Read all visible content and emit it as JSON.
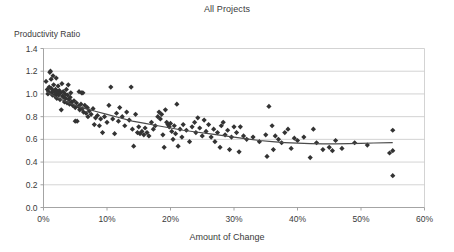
{
  "chart_data": {
    "type": "scatter",
    "title": "All Projects",
    "xlabel": "Amount of Change",
    "ylabel": "Productivity Ratio",
    "xlim": [
      0,
      60
    ],
    "ylim": [
      0.0,
      1.4
    ],
    "x_tick_labels": [
      "0%",
      "10%",
      "20%",
      "30%",
      "40%",
      "50%",
      "60%"
    ],
    "x_ticks": [
      0,
      10,
      20,
      30,
      40,
      50,
      60
    ],
    "y_tick_labels": [
      "0.0",
      "0.2",
      "0.4",
      "0.6",
      "0.8",
      "1.0",
      "1.2",
      "1.4"
    ],
    "y_ticks": [
      0.0,
      0.2,
      0.4,
      0.6,
      0.8,
      1.0,
      1.2,
      1.4
    ],
    "grid": "horizontal",
    "legend": "none",
    "marker": {
      "shape": "diamond",
      "color": "#333333",
      "size": 2.6
    },
    "series": [
      {
        "name": "Projects",
        "points": [
          [
            0.4,
            1.11
          ],
          [
            0.6,
            1.04
          ],
          [
            0.7,
            1.0
          ],
          [
            0.8,
            1.02
          ],
          [
            0.9,
            1.06
          ],
          [
            1.0,
            1.19
          ],
          [
            1.1,
            1.2
          ],
          [
            1.2,
            1.13
          ],
          [
            1.2,
            1.05
          ],
          [
            1.3,
            1.01
          ],
          [
            1.4,
            0.99
          ],
          [
            1.5,
            1.03
          ],
          [
            1.5,
            1.16
          ],
          [
            1.6,
            1.08
          ],
          [
            1.7,
            1.02
          ],
          [
            1.8,
            0.98
          ],
          [
            1.9,
            1.04
          ],
          [
            2.0,
            1.14
          ],
          [
            2.0,
            1.0
          ],
          [
            2.1,
            0.96
          ],
          [
            2.2,
            1.02
          ],
          [
            2.3,
            1.07
          ],
          [
            2.4,
            0.99
          ],
          [
            2.5,
            1.03
          ],
          [
            2.6,
            0.95
          ],
          [
            2.7,
            1.01
          ],
          [
            2.8,
            0.86
          ],
          [
            2.9,
            1.09
          ],
          [
            3.0,
            0.98
          ],
          [
            3.1,
            1.02
          ],
          [
            3.2,
            0.97
          ],
          [
            3.3,
            0.93
          ],
          [
            3.4,
            1.0
          ],
          [
            3.5,
            0.96
          ],
          [
            3.6,
            1.04
          ],
          [
            3.7,
            0.92
          ],
          [
            3.8,
            0.99
          ],
          [
            3.9,
            1.08
          ],
          [
            4.0,
            0.95
          ],
          [
            4.1,
            0.91
          ],
          [
            4.2,
            0.97
          ],
          [
            4.3,
            1.01
          ],
          [
            4.4,
            0.93
          ],
          [
            4.6,
            0.9
          ],
          [
            4.8,
            0.94
          ],
          [
            5.0,
            0.88
          ],
          [
            5.0,
            0.76
          ],
          [
            5.2,
            0.92
          ],
          [
            5.3,
            0.76
          ],
          [
            5.5,
            0.89
          ],
          [
            5.6,
            1.02
          ],
          [
            5.7,
            0.86
          ],
          [
            5.9,
            0.91
          ],
          [
            6.0,
            1.01
          ],
          [
            6.1,
            0.87
          ],
          [
            6.2,
            1.01
          ],
          [
            6.3,
            0.84
          ],
          [
            6.5,
            0.9
          ],
          [
            6.7,
            0.83
          ],
          [
            6.9,
            0.88
          ],
          [
            7.0,
            0.8
          ],
          [
            7.2,
            0.85
          ],
          [
            7.5,
            0.82
          ],
          [
            7.8,
            0.87
          ],
          [
            8.0,
            0.73
          ],
          [
            8.2,
            0.79
          ],
          [
            8.5,
            0.81
          ],
          [
            8.8,
            0.72
          ],
          [
            9.0,
            0.78
          ],
          [
            9.3,
            0.66
          ],
          [
            9.6,
            0.8
          ],
          [
            10.0,
            0.75
          ],
          [
            10.3,
            0.9
          ],
          [
            10.6,
            1.06
          ],
          [
            10.9,
            0.78
          ],
          [
            11.2,
            0.65
          ],
          [
            11.5,
            0.83
          ],
          [
            11.8,
            0.76
          ],
          [
            12.0,
            0.88
          ],
          [
            12.4,
            0.8
          ],
          [
            12.8,
            0.72
          ],
          [
            13.1,
            0.84
          ],
          [
            13.5,
            0.77
          ],
          [
            13.8,
            1.06
          ],
          [
            14.0,
            0.69
          ],
          [
            14.2,
            0.54
          ],
          [
            14.5,
            0.82
          ],
          [
            14.8,
            0.66
          ],
          [
            15.0,
            0.71
          ],
          [
            15.2,
            0.65
          ],
          [
            15.5,
            0.67
          ],
          [
            15.8,
            0.64
          ],
          [
            16.0,
            0.7
          ],
          [
            16.3,
            0.66
          ],
          [
            16.6,
            0.63
          ],
          [
            17.0,
            0.75
          ],
          [
            17.3,
            0.69
          ],
          [
            17.6,
            0.72
          ],
          [
            18.0,
            0.8
          ],
          [
            18.2,
            0.84
          ],
          [
            18.4,
            0.78
          ],
          [
            18.6,
            0.82
          ],
          [
            18.8,
            0.64
          ],
          [
            19.0,
            0.53
          ],
          [
            19.2,
            0.86
          ],
          [
            19.4,
            0.75
          ],
          [
            19.6,
            0.73
          ],
          [
            19.8,
            0.71
          ],
          [
            20.0,
            0.74
          ],
          [
            20.2,
            0.67
          ],
          [
            20.4,
            0.6
          ],
          [
            20.6,
            0.72
          ],
          [
            20.8,
            0.65
          ],
          [
            21.0,
            0.91
          ],
          [
            21.2,
            0.54
          ],
          [
            21.5,
            0.69
          ],
          [
            21.8,
            0.62
          ],
          [
            22.0,
            0.73
          ],
          [
            22.5,
            0.68
          ],
          [
            23.0,
            0.58
          ],
          [
            23.4,
            0.71
          ],
          [
            23.8,
            0.75
          ],
          [
            24.0,
            0.66
          ],
          [
            24.3,
            0.79
          ],
          [
            24.6,
            0.7
          ],
          [
            25.0,
            0.63
          ],
          [
            25.3,
            0.77
          ],
          [
            25.6,
            0.67
          ],
          [
            26.0,
            0.73
          ],
          [
            26.4,
            0.62
          ],
          [
            26.8,
            0.69
          ],
          [
            27.0,
            0.58
          ],
          [
            27.4,
            0.66
          ],
          [
            27.8,
            0.53
          ],
          [
            28.0,
            0.72
          ],
          [
            28.3,
            0.75
          ],
          [
            28.6,
            0.64
          ],
          [
            29.0,
            0.68
          ],
          [
            29.3,
            0.51
          ],
          [
            29.6,
            0.62
          ],
          [
            30.0,
            0.71
          ],
          [
            30.4,
            0.66
          ],
          [
            30.8,
            0.49
          ],
          [
            31.0,
            0.71
          ],
          [
            31.5,
            0.63
          ],
          [
            32.0,
            0.6
          ],
          [
            33.0,
            0.62
          ],
          [
            34.0,
            0.58
          ],
          [
            35.0,
            0.64
          ],
          [
            35.2,
            0.45
          ],
          [
            35.5,
            0.89
          ],
          [
            36.0,
            0.72
          ],
          [
            36.2,
            0.51
          ],
          [
            36.5,
            0.63
          ],
          [
            37.0,
            0.6
          ],
          [
            37.5,
            0.57
          ],
          [
            38.0,
            0.66
          ],
          [
            38.5,
            0.69
          ],
          [
            39.0,
            0.52
          ],
          [
            39.5,
            0.61
          ],
          [
            40.0,
            0.59
          ],
          [
            41.0,
            0.62
          ],
          [
            42.0,
            0.44
          ],
          [
            42.5,
            0.69
          ],
          [
            43.0,
            0.57
          ],
          [
            44.0,
            0.51
          ],
          [
            45.0,
            0.53
          ],
          [
            45.5,
            0.5
          ],
          [
            46.0,
            0.59
          ],
          [
            47.0,
            0.52
          ],
          [
            49.0,
            0.57
          ],
          [
            51.0,
            0.55
          ],
          [
            54.5,
            0.48
          ],
          [
            55.0,
            0.68
          ],
          [
            55.0,
            0.5
          ],
          [
            55.0,
            0.28
          ]
        ]
      }
    ],
    "trendline": {
      "name": "fitted curve",
      "color": "#4a4a4a",
      "points": [
        [
          0.5,
          1.02
        ],
        [
          2,
          0.97
        ],
        [
          4,
          0.92
        ],
        [
          6,
          0.88
        ],
        [
          8,
          0.85
        ],
        [
          10,
          0.82
        ],
        [
          12,
          0.79
        ],
        [
          14,
          0.76
        ],
        [
          16,
          0.74
        ],
        [
          18,
          0.72
        ],
        [
          20,
          0.7
        ],
        [
          22,
          0.68
        ],
        [
          24,
          0.665
        ],
        [
          26,
          0.65
        ],
        [
          28,
          0.635
        ],
        [
          30,
          0.62
        ],
        [
          32,
          0.605
        ],
        [
          34,
          0.59
        ],
        [
          36,
          0.58
        ],
        [
          38,
          0.572
        ],
        [
          40,
          0.566
        ],
        [
          42,
          0.562
        ],
        [
          44,
          0.56
        ],
        [
          46,
          0.56
        ],
        [
          48,
          0.562
        ],
        [
          50,
          0.565
        ],
        [
          52,
          0.568
        ],
        [
          55,
          0.572
        ]
      ]
    },
    "colors": {
      "marker": "#333333",
      "trendline": "#4a4a4a",
      "gridline": "#c8c8c8",
      "axis": "#9a9a9a",
      "text": "#3a3a3a",
      "background": "#ffffff"
    }
  }
}
